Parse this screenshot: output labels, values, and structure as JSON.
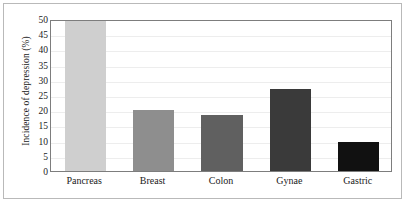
{
  "chart_data": {
    "type": "bar",
    "title": "",
    "xlabel": "",
    "ylabel": "Incidence of depression (%)",
    "categories": [
      "Pancreas",
      "Breast",
      "Colon",
      "Gynae",
      "Gastric"
    ],
    "values": [
      50,
      20,
      18.5,
      27,
      9.5
    ],
    "ylim": [
      0,
      50
    ],
    "yticks": [
      0,
      5,
      10,
      15,
      20,
      25,
      30,
      35,
      40,
      45,
      50
    ],
    "ytick_labels": [
      "0",
      "5",
      "10",
      "15",
      "20",
      "25",
      "30",
      "35",
      "40",
      "45",
      "50"
    ],
    "grid": true,
    "legend": "none",
    "bar_colors": [
      "#cfcfcf",
      "#8e8e8e",
      "#606060",
      "#3a3a3a",
      "#111111"
    ],
    "frame_color": "#7d7d7d",
    "gridline_color": "#ededed",
    "background": "#ffffff",
    "text_color": "#1b1b1b"
  }
}
